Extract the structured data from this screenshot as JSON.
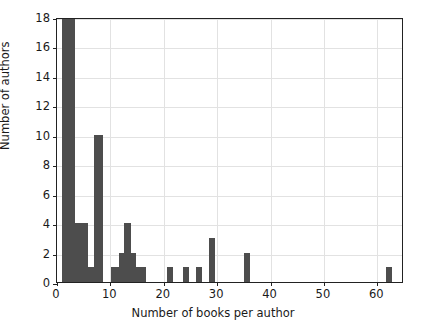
{
  "chart_data": {
    "type": "bar",
    "title": "",
    "xlabel": "Number of books per author",
    "ylabel": "Number of authors",
    "xlim": [
      0,
      65
    ],
    "ylim": [
      0,
      18
    ],
    "grid": true,
    "legend": null,
    "bar_color": "#4d4d4d",
    "xticks": [
      0,
      10,
      20,
      30,
      40,
      50,
      60
    ],
    "xticklabels": [
      "0",
      "10",
      "20",
      "30",
      "40",
      "50",
      "60"
    ],
    "yticks": [
      0,
      2,
      4,
      6,
      8,
      10,
      12,
      14,
      16,
      18
    ],
    "yticklabels": [
      "0",
      "2",
      "4",
      "6",
      "8",
      "10",
      "12",
      "14",
      "16",
      "18"
    ],
    "bin_width": 2.4,
    "bins": [
      {
        "x0": 1.0,
        "x1": 3.4,
        "value": 18
      },
      {
        "x0": 3.4,
        "x1": 5.8,
        "value": 4
      },
      {
        "x0": 5.8,
        "x1": 7.0,
        "value": 1
      },
      {
        "x0": 7.0,
        "x1": 8.6,
        "value": 10
      },
      {
        "x0": 10.2,
        "x1": 11.6,
        "value": 1
      },
      {
        "x0": 11.6,
        "x1": 12.6,
        "value": 2
      },
      {
        "x0": 12.6,
        "x1": 13.9,
        "value": 4
      },
      {
        "x0": 13.9,
        "x1": 14.8,
        "value": 2
      },
      {
        "x0": 14.8,
        "x1": 16.6,
        "value": 1
      },
      {
        "x0": 20.6,
        "x1": 21.8,
        "value": 1
      },
      {
        "x0": 23.6,
        "x1": 24.8,
        "value": 1
      },
      {
        "x0": 26.0,
        "x1": 27.2,
        "value": 1
      },
      {
        "x0": 28.4,
        "x1": 29.6,
        "value": 3
      },
      {
        "x0": 35.0,
        "x1": 36.2,
        "value": 2
      },
      {
        "x0": 61.6,
        "x1": 62.8,
        "value": 1
      }
    ]
  }
}
